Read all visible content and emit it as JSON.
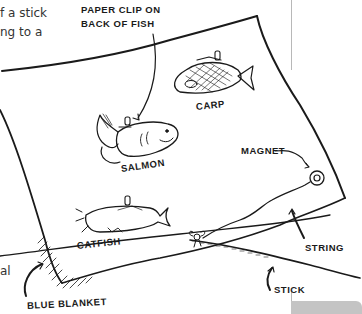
{
  "body_text": {
    "line1": "f a stick",
    "line2": "ng to a",
    "line3": "al"
  },
  "figure": {
    "labels": {
      "paper_clip_line1": "PAPER CLIP ON",
      "paper_clip_line2": "BACK OF FISH",
      "carp": "CARP",
      "salmon": "SALMON",
      "magnet": "MAGNET",
      "catfish": "CATFISH",
      "string": "STRING",
      "stick": "STICK",
      "blanket": "BLUE BLANKET"
    },
    "colors": {
      "ink": "#1a1a1a",
      "text": "#333333",
      "rule": "#b8b8b8",
      "tab": "#c4c4c4"
    }
  }
}
